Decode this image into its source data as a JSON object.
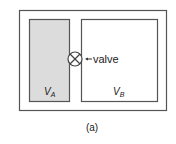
{
  "diagram": {
    "valve_label": "valve",
    "volume_a": {
      "symbol": "V",
      "subscript": "A"
    },
    "volume_b": {
      "symbol": "V",
      "subscript": "B"
    },
    "caption": "(a)",
    "colors": {
      "stroke": "#555555",
      "shaded": "#dcdcdc",
      "background": "#ffffff"
    }
  }
}
